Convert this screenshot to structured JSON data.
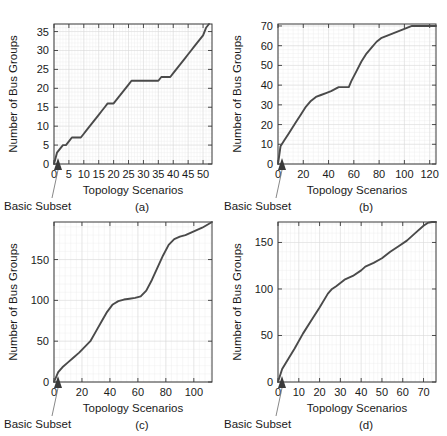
{
  "figure": {
    "common": {
      "ylabel": "Number of Bus Groups",
      "xlabel": "Topology Scenarios",
      "annotation": "Basic Subset"
    },
    "panels": [
      {
        "id": "a",
        "caption": "(a)"
      },
      {
        "id": "b",
        "caption": "(b)"
      },
      {
        "id": "c",
        "caption": "(c)"
      },
      {
        "id": "d",
        "caption": "(d)"
      }
    ]
  },
  "chart_data": [
    {
      "type": "line",
      "panel": "(a)",
      "title": "",
      "xlabel": "Topology Scenarios",
      "ylabel": "Number of Bus Groups",
      "xlim": [
        0,
        53
      ],
      "ylim": [
        0,
        37
      ],
      "xticks": [
        0,
        5,
        10,
        15,
        20,
        25,
        30,
        35,
        40,
        45,
        50
      ],
      "xtick_labels": [
        "0",
        "5",
        "10",
        "15",
        "20",
        "25",
        "30",
        "35",
        "40",
        "45",
        "50"
      ],
      "yticks": [
        0,
        5,
        10,
        15,
        20,
        25,
        30,
        35
      ],
      "ytick_labels": [
        "0",
        "5",
        "10",
        "15",
        "20",
        "25",
        "30",
        "35"
      ],
      "grid": true,
      "legend": false,
      "annotations": [
        {
          "text": "Basic Subset",
          "points_to_x": 0,
          "points_to_y": 0
        }
      ],
      "x": [
        0,
        1,
        2,
        3,
        4,
        5,
        6,
        7,
        8,
        9,
        10,
        11,
        12,
        13,
        14,
        15,
        16,
        17,
        18,
        19,
        20,
        21,
        22,
        23,
        24,
        25,
        26,
        27,
        28,
        29,
        30,
        31,
        32,
        33,
        34,
        35,
        36,
        37,
        38,
        39,
        40,
        41,
        42,
        43,
        44,
        45,
        46,
        47,
        48,
        49,
        50,
        51,
        52
      ],
      "y": [
        0,
        3,
        4,
        5,
        5,
        6,
        7,
        7,
        7,
        7,
        8,
        9,
        10,
        11,
        12,
        13,
        14,
        15,
        16,
        16,
        16,
        17,
        18,
        19,
        20,
        21,
        22,
        22,
        22,
        22,
        22,
        22,
        22,
        22,
        22,
        22,
        23,
        23,
        23,
        23,
        24,
        25,
        26,
        27,
        28,
        29,
        30,
        31,
        32,
        33,
        34,
        36,
        37
      ]
    },
    {
      "type": "line",
      "panel": "(b)",
      "title": "",
      "xlabel": "Topology Scenarios",
      "ylabel": "Number of Bus Groups",
      "xlim": [
        0,
        125
      ],
      "ylim": [
        0,
        71
      ],
      "xticks": [
        0,
        20,
        40,
        60,
        80,
        100,
        120
      ],
      "xtick_labels": [
        "0",
        "20",
        "40",
        "60",
        "80",
        "100",
        "120"
      ],
      "yticks": [
        0,
        10,
        20,
        30,
        40,
        50,
        60,
        70
      ],
      "ytick_labels": [
        "0",
        "10",
        "20",
        "30",
        "40",
        "50",
        "60",
        "70"
      ],
      "grid": true,
      "legend": false,
      "annotations": [
        {
          "text": "Basic Subset",
          "points_to_x": 0,
          "points_to_y": 0
        }
      ],
      "x": [
        0,
        2,
        5,
        8,
        10,
        14,
        18,
        22,
        26,
        28,
        30,
        34,
        38,
        42,
        45,
        48,
        52,
        56,
        58,
        62,
        66,
        70,
        74,
        78,
        82,
        86,
        90,
        94,
        98,
        102,
        106,
        110,
        114,
        118,
        122,
        125
      ],
      "y": [
        0,
        9,
        12,
        15,
        17,
        21,
        25,
        29,
        32,
        33,
        34,
        35,
        36,
        37,
        38,
        39,
        39,
        39,
        42,
        47,
        52,
        56,
        59,
        62,
        64,
        65,
        66,
        67,
        68,
        69,
        70,
        70,
        70,
        70,
        70,
        70
      ]
    },
    {
      "type": "line",
      "panel": "(c)",
      "title": "",
      "xlabel": "Topology Scenarios",
      "ylabel": "Number of Bus Groups",
      "xlim": [
        0,
        113
      ],
      "ylim": [
        0,
        196
      ],
      "xticks": [
        0,
        20,
        40,
        60,
        80,
        100
      ],
      "xtick_labels": [
        "0",
        "20",
        "40",
        "60",
        "80",
        "100"
      ],
      "yticks": [
        0,
        50,
        100,
        150
      ],
      "ytick_labels": [
        "0",
        "50",
        "100",
        "150"
      ],
      "grid": true,
      "legend": false,
      "annotations": [
        {
          "text": "Basic Subset",
          "points_to_x": 0,
          "points_to_y": 0
        }
      ],
      "x": [
        0,
        3,
        6,
        10,
        14,
        18,
        22,
        26,
        30,
        34,
        38,
        42,
        46,
        50,
        54,
        58,
        62,
        66,
        70,
        74,
        78,
        82,
        86,
        90,
        94,
        98,
        102,
        106,
        110,
        113
      ],
      "y": [
        0,
        12,
        18,
        24,
        30,
        36,
        43,
        50,
        62,
        74,
        86,
        95,
        99,
        101,
        102,
        103,
        105,
        112,
        125,
        140,
        155,
        168,
        175,
        178,
        180,
        183,
        186,
        189,
        193,
        196
      ]
    },
    {
      "type": "line",
      "panel": "(d)",
      "title": "",
      "xlabel": "Topology Scenarios",
      "ylabel": "Number of Bus Groups",
      "xlim": [
        0,
        76
      ],
      "ylim": [
        0,
        172
      ],
      "xticks": [
        0,
        10,
        20,
        30,
        40,
        50,
        60,
        70
      ],
      "xtick_labels": [
        "0",
        "10",
        "20",
        "30",
        "40",
        "50",
        "60",
        "70"
      ],
      "yticks": [
        0,
        50,
        100,
        150
      ],
      "ytick_labels": [
        "0",
        "50",
        "100",
        "150"
      ],
      "grid": true,
      "legend": false,
      "annotations": [
        {
          "text": "Basic Subset",
          "points_to_x": 0,
          "points_to_y": 0
        }
      ],
      "x": [
        0,
        2,
        5,
        8,
        12,
        16,
        20,
        24,
        26,
        28,
        32,
        36,
        40,
        42,
        46,
        50,
        54,
        58,
        62,
        66,
        70,
        72,
        74,
        76
      ],
      "y": [
        0,
        14,
        25,
        36,
        52,
        66,
        80,
        95,
        100,
        103,
        110,
        114,
        120,
        124,
        128,
        133,
        140,
        146,
        152,
        160,
        168,
        171,
        172,
        172
      ]
    }
  ]
}
